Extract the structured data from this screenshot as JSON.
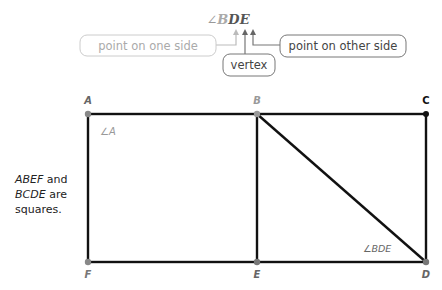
{
  "callout": {
    "angle_symbol": "∠",
    "angle_letters": [
      "B",
      "D",
      "E"
    ],
    "boxes": [
      {
        "id": "side1",
        "label": "point on one side",
        "faded": true
      },
      {
        "id": "vertex",
        "label": "vertex",
        "faded": false
      },
      {
        "id": "side2",
        "label": "point on other side",
        "faded": false
      }
    ]
  },
  "figure": {
    "points": {
      "A": {
        "label": "A",
        "x": 88,
        "y": 114
      },
      "B": {
        "label": "B",
        "x": 257,
        "y": 114
      },
      "C": {
        "label": "C",
        "x": 426,
        "y": 114
      },
      "D": {
        "label": "D",
        "x": 426,
        "y": 262
      },
      "E": {
        "label": "E",
        "x": 257,
        "y": 262
      },
      "F": {
        "label": "F",
        "x": 88,
        "y": 262
      }
    },
    "angle_labels": {
      "angle_a": "∠A",
      "angle_bde": "∠BDE"
    }
  },
  "note": {
    "line1_italic": "ABEF",
    "line1_rest": " and",
    "line2_italic": "BCDE",
    "line2_rest": " are",
    "line3": "squares."
  }
}
